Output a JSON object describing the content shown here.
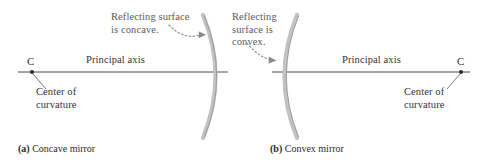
{
  "figure": {
    "background_color": "#ffffff",
    "text_color_annotation": "#5b5b5b",
    "text_color_label": "#333333",
    "line_color": "#4a4a4a",
    "mirror_color": "#b9b9b9"
  },
  "panels": [
    {
      "id": "concave",
      "caption_marker": "(a)",
      "caption_text": "Concave mirror",
      "annotation_line1": "Reflecting surface",
      "annotation_line2": "is concave.",
      "axis_label": "Principal axis",
      "center_marker": "C",
      "center_label_line1": "Center of",
      "center_label_line2": "curvature",
      "mirror_type": "concave",
      "mirror_vertex_x": 217,
      "center_point_x": 32,
      "center_point_y": 72
    },
    {
      "id": "convex",
      "caption_marker": "(b)",
      "caption_text": "Convex mirror",
      "annotation_line1": "Reflecting",
      "annotation_line2": "surface is",
      "annotation_line3": "convex.",
      "axis_label": "Principal axis",
      "center_marker": "C",
      "center_label_line1": "Center of",
      "center_label_line2": "curvature",
      "mirror_type": "convex",
      "mirror_vertex_x": 283,
      "center_point_x": 461,
      "center_point_y": 72
    }
  ]
}
